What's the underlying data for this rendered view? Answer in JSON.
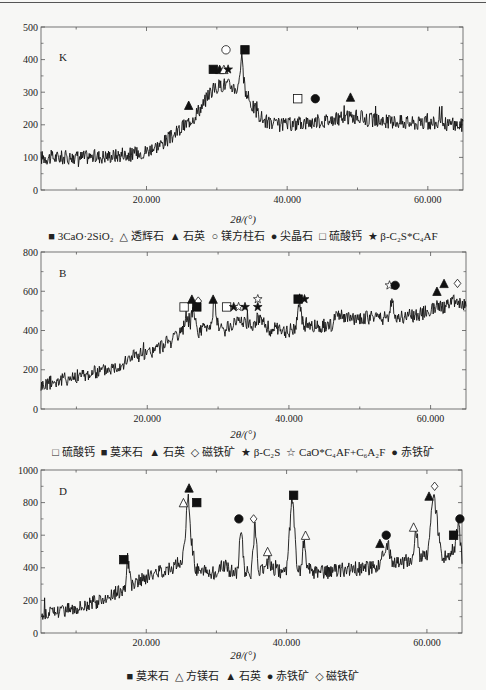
{
  "chart_data": [
    {
      "type": "line",
      "panel_label": "K",
      "title": "",
      "xlabel": "2θ/(°)",
      "ylabel": "",
      "xlim": [
        5,
        65
      ],
      "ylim": [
        0,
        500
      ],
      "x_ticks": [
        "20.000",
        "40.000",
        "60.000"
      ],
      "y_ticks": [
        "0",
        "100",
        "200",
        "300",
        "400",
        "500"
      ],
      "grid": false,
      "series": [
        {
          "name": "XRD pattern K",
          "x": [
            5,
            10,
            15,
            18,
            20,
            22,
            24,
            26,
            28,
            29,
            30,
            31,
            32,
            33,
            33.5,
            34,
            35,
            36,
            37,
            38,
            40,
            42,
            44,
            46,
            48,
            50,
            52,
            54,
            56,
            58,
            60,
            62,
            64,
            65
          ],
          "values": [
            100,
            100,
            105,
            110,
            120,
            140,
            170,
            210,
            260,
            300,
            315,
            325,
            320,
            310,
            410,
            300,
            260,
            230,
            210,
            200,
            200,
            205,
            210,
            215,
            220,
            225,
            215,
            210,
            210,
            205,
            205,
            205,
            200,
            200
          ]
        }
      ],
      "annotations": [
        {
          "symbol": "filled-triangle",
          "x": 26,
          "y": 260
        },
        {
          "symbol": "filled-square",
          "x": 29.5,
          "y": 370
        },
        {
          "symbol": "filled-triangle",
          "x": 30.4,
          "y": 370
        },
        {
          "symbol": "open-triangle",
          "x": 31,
          "y": 370
        },
        {
          "symbol": "filled-star",
          "x": 31.6,
          "y": 370
        },
        {
          "symbol": "open-circle",
          "x": 31.3,
          "y": 430
        },
        {
          "symbol": "filled-square",
          "x": 34,
          "y": 430
        },
        {
          "symbol": "open-square",
          "x": 41.5,
          "y": 280
        },
        {
          "symbol": "filled-circle",
          "x": 44,
          "y": 280
        },
        {
          "symbol": "filled-triangle",
          "x": 49,
          "y": 285
        }
      ],
      "legend": [
        {
          "symbol": "■",
          "label": "3CaO·2SiO₂"
        },
        {
          "symbol": "△",
          "label": "透辉石"
        },
        {
          "symbol": "▲",
          "label": "石英"
        },
        {
          "symbol": "○",
          "label": "镁方柱石"
        },
        {
          "symbol": "●",
          "label": "尖晶石"
        },
        {
          "symbol": "□",
          "label": "硫酸钙"
        },
        {
          "symbol": "★",
          "label": "β-C₂S*C₄AF"
        }
      ],
      "legend_position": "bottom"
    },
    {
      "type": "line",
      "panel_label": "B",
      "title": "",
      "xlabel": "2θ/(°)",
      "ylabel": "",
      "xlim": [
        5,
        65
      ],
      "ylim": [
        0,
        800
      ],
      "x_ticks": [
        "20.000",
        "40.000",
        "60.000"
      ],
      "y_ticks": [
        "0",
        "200",
        "400",
        "600",
        "800"
      ],
      "grid": false,
      "series": [
        {
          "name": "XRD pattern B",
          "x": [
            5,
            8,
            10,
            12,
            15,
            17,
            18,
            19,
            20,
            22,
            24,
            25,
            25.5,
            26,
            26.5,
            27,
            28,
            29,
            29.5,
            30,
            31,
            32,
            33,
            34,
            35,
            36,
            37,
            38,
            39,
            40,
            41,
            41.5,
            42,
            44,
            46,
            47,
            48,
            50,
            52,
            54,
            54.5,
            55,
            56,
            58,
            60,
            61,
            62,
            63,
            64,
            65
          ],
          "values": [
            120,
            150,
            165,
            180,
            210,
            240,
            280,
            260,
            280,
            320,
            360,
            390,
            490,
            410,
            530,
            390,
            410,
            430,
            560,
            420,
            400,
            430,
            460,
            440,
            430,
            480,
            390,
            410,
            390,
            400,
            420,
            560,
            420,
            420,
            430,
            480,
            460,
            460,
            470,
            460,
            560,
            470,
            470,
            480,
            500,
            540,
            510,
            560,
            540,
            520
          ]
        }
      ],
      "annotations": [
        {
          "symbol": "open-square",
          "x": 25.2,
          "y": 520
        },
        {
          "symbol": "filled-triangle",
          "x": 26.3,
          "y": 560
        },
        {
          "symbol": "open-diamond",
          "x": 27.2,
          "y": 550
        },
        {
          "symbol": "filled-square",
          "x": 27,
          "y": 520
        },
        {
          "symbol": "filled-triangle",
          "x": 29.3,
          "y": 560
        },
        {
          "symbol": "open-square",
          "x": 31.2,
          "y": 520
        },
        {
          "symbol": "filled-star",
          "x": 32.2,
          "y": 520
        },
        {
          "symbol": "open-star",
          "x": 32.9,
          "y": 520
        },
        {
          "symbol": "filled-star",
          "x": 33.8,
          "y": 520
        },
        {
          "symbol": "filled-star",
          "x": 35.6,
          "y": 520
        },
        {
          "symbol": "open-star",
          "x": 35.6,
          "y": 560
        },
        {
          "symbol": "filled-square",
          "x": 41.3,
          "y": 560
        },
        {
          "symbol": "filled-star",
          "x": 42.2,
          "y": 560
        },
        {
          "symbol": "open-star",
          "x": 54.2,
          "y": 630
        },
        {
          "symbol": "filled-circle",
          "x": 55,
          "y": 630
        },
        {
          "symbol": "filled-triangle",
          "x": 60.9,
          "y": 600
        },
        {
          "symbol": "filled-triangle",
          "x": 61.9,
          "y": 640
        },
        {
          "symbol": "open-diamond",
          "x": 63.8,
          "y": 640
        }
      ],
      "legend": [
        {
          "symbol": "□",
          "label": "硫酸钙"
        },
        {
          "symbol": "■",
          "label": "莫来石"
        },
        {
          "symbol": "▲",
          "label": "石英"
        },
        {
          "symbol": "◇",
          "label": "磁铁矿"
        },
        {
          "symbol": "★",
          "label": "β-C₂S"
        },
        {
          "symbol": "☆",
          "label": "CaO*C₄AF+C₆A₂F"
        },
        {
          "symbol": "●",
          "label": "赤铁矿"
        }
      ],
      "legend_position": "bottom"
    },
    {
      "type": "line",
      "panel_label": "D",
      "title": "",
      "xlabel": "2θ/(°)",
      "ylabel": "",
      "xlim": [
        5,
        65
      ],
      "ylim": [
        0,
        1000
      ],
      "x_ticks": [
        "20.000",
        "40.000",
        "60.000"
      ],
      "y_ticks": [
        "0",
        "200",
        "400",
        "600",
        "800",
        "1000"
      ],
      "grid": false,
      "series": [
        {
          "name": "XRD pattern D",
          "x": [
            5,
            8,
            10,
            12,
            14,
            16,
            17,
            17.3,
            18,
            20,
            22,
            24,
            25,
            25.5,
            26,
            26.3,
            27,
            28,
            30,
            31,
            32,
            33,
            33.5,
            34,
            35,
            35.5,
            36,
            37,
            37.5,
            38,
            39,
            40,
            40.8,
            41.5,
            42,
            42.5,
            43,
            44,
            46,
            48,
            50,
            52,
            53,
            54,
            54.5,
            55,
            56,
            57,
            58,
            58.5,
            59,
            60,
            61,
            62,
            63,
            64,
            64.5,
            65
          ],
          "values": [
            110,
            140,
            160,
            180,
            210,
            250,
            280,
            460,
            290,
            340,
            380,
            410,
            430,
            560,
            870,
            600,
            400,
            380,
            370,
            420,
            380,
            370,
            680,
            380,
            370,
            690,
            380,
            370,
            470,
            380,
            380,
            380,
            850,
            400,
            380,
            580,
            390,
            370,
            370,
            390,
            390,
            400,
            420,
            480,
            540,
            430,
            430,
            440,
            460,
            640,
            470,
            480,
            850,
            480,
            470,
            530,
            690,
            460
          ]
        }
      ],
      "annotations": [
        {
          "symbol": "filled-square",
          "x": 16.8,
          "y": 450
        },
        {
          "symbol": "open-triangle",
          "x": 25.3,
          "y": 800
        },
        {
          "symbol": "filled-triangle",
          "x": 26.1,
          "y": 890
        },
        {
          "symbol": "filled-square",
          "x": 27.2,
          "y": 800
        },
        {
          "symbol": "filled-circle",
          "x": 33.2,
          "y": 700
        },
        {
          "symbol": "open-diamond",
          "x": 35.3,
          "y": 700
        },
        {
          "symbol": "open-triangle",
          "x": 37.3,
          "y": 500
        },
        {
          "symbol": "filled-square",
          "x": 41.0,
          "y": 845
        },
        {
          "symbol": "open-triangle",
          "x": 42.7,
          "y": 600
        },
        {
          "symbol": "filled-triangle",
          "x": 53.3,
          "y": 550
        },
        {
          "symbol": "filled-circle",
          "x": 54.2,
          "y": 600
        },
        {
          "symbol": "open-triangle",
          "x": 58.1,
          "y": 650
        },
        {
          "symbol": "filled-triangle",
          "x": 60.3,
          "y": 840
        },
        {
          "symbol": "open-diamond",
          "x": 61.1,
          "y": 900
        },
        {
          "symbol": "filled-square",
          "x": 63.8,
          "y": 600
        },
        {
          "symbol": "filled-circle",
          "x": 64.7,
          "y": 700
        }
      ],
      "legend": [
        {
          "symbol": "■",
          "label": "莫来石"
        },
        {
          "symbol": "△",
          "label": "方镁石"
        },
        {
          "symbol": "▲",
          "label": "石英"
        },
        {
          "symbol": "●",
          "label": "赤铁矿"
        },
        {
          "symbol": "◇",
          "label": "磁铁矿"
        }
      ],
      "legend_position": "bottom"
    }
  ],
  "panels": [
    {
      "label": "K",
      "xlabel": "2θ/(°)"
    },
    {
      "label": "B",
      "xlabel": "2θ/(°)"
    },
    {
      "label": "D",
      "xlabel": "2θ/(°)"
    }
  ]
}
